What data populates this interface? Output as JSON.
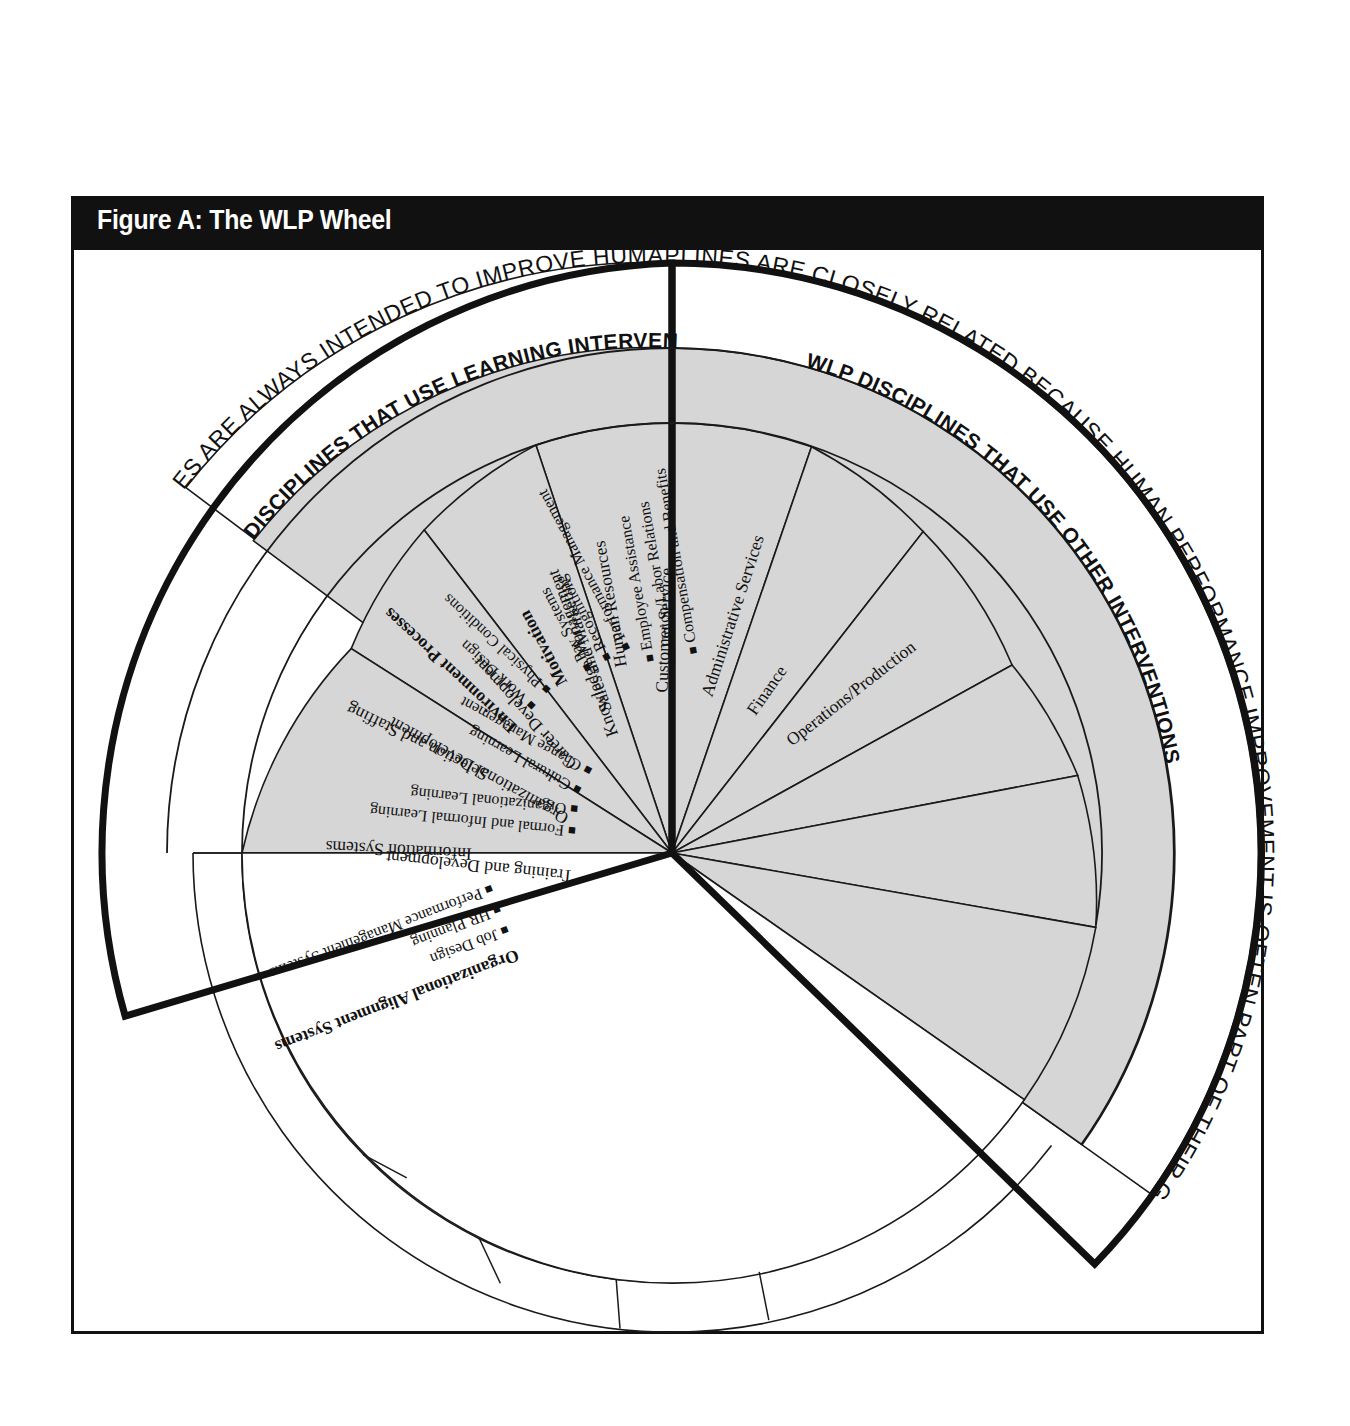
{
  "figure": {
    "title": "Figure A: The WLP Wheel"
  },
  "outer_statements": {
    "left": "THESE DISCIPLINES ARE ALWAYS INTENDED TO IMPROVE HUMAN PERFORMANCE.",
    "right": "THESE DISCIPLINES ARE CLOSELY RELATED BECAUSE HUMAN PERFORMANCE IMPROVEMENT IS OFTEN PART OF THEIR GOAL."
  },
  "bands": {
    "left": "WLP DISCIPLINES THAT USE LEARNING INTERVENTIONS",
    "right": "WLP DISCIPLINES THAT USE OTHER INTERVENTIONS",
    "bottom": "NON-WLP DISCIPLINES"
  },
  "sectors": {
    "learning": [
      {
        "name": "Knowledge Management",
        "bullets": []
      },
      {
        "name": "Career Development",
        "bullets": []
      },
      {
        "name": "Organizational Development",
        "bullets": [
          "Cultural Learning",
          "Change Management"
        ]
      },
      {
        "name": "Training and Development",
        "bullets": [
          "Formal and Informal Learning",
          "Organizational Learning"
        ]
      }
    ],
    "other": [
      {
        "name": "Human Resources",
        "bullets": [
          "Employee Assistance",
          "Union/Labor Relations",
          "Compensation and Benefits"
        ]
      },
      {
        "name": "Motivation",
        "bullets": [
          "Pay Systems",
          "Recognition",
          "Performance Management"
        ]
      },
      {
        "name": "Environment Processes",
        "bullets": [
          "Work Design",
          "Physical Conditions"
        ]
      },
      {
        "name": "Selection and Staffing",
        "bullets": []
      },
      {
        "name": "Information Systems",
        "bullets": []
      },
      {
        "name": "Organizational Alignment Systems",
        "bullets": [
          "Job Design",
          "HR Planning",
          "Performance Management Systems"
        ]
      }
    ],
    "non_wlp": [
      {
        "name": "Operations/Production"
      },
      {
        "name": "Finance"
      },
      {
        "name": "Administrative Services"
      },
      {
        "name": "Customer Service"
      },
      {
        "name": "Sales and Marketing"
      }
    ]
  },
  "colors": {
    "ink": "#111111",
    "shaded_sector": "#d6d6d6",
    "background": "#ffffff",
    "title_bar": "#111111",
    "title_text": "#ffffff"
  }
}
